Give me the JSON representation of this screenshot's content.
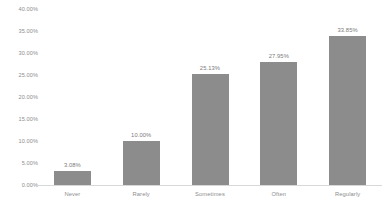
{
  "chart_data": {
    "type": "bar",
    "title": "",
    "xlabel": "",
    "ylabel": "",
    "categories": [
      "Never",
      "Rarely",
      "Sometimes",
      "Often",
      "Regularly"
    ],
    "values": [
      3.08,
      10.0,
      25.13,
      27.95,
      33.85
    ],
    "data_labels": [
      "3.08%",
      "10.00%",
      "25.13%",
      "27.95%",
      "33.85%"
    ],
    "ylim": [
      0,
      40
    ],
    "ytick_values": [
      40,
      35,
      30,
      25,
      20,
      15,
      10,
      5,
      0
    ],
    "ytick_labels": [
      "40.00%",
      "35.00%",
      "30.00%",
      "25.00%",
      "20.00%",
      "15.00%",
      "10.00%",
      "5.00%",
      "0.00%"
    ],
    "grid": false,
    "legend": false,
    "series": [
      {
        "name": "Series 1",
        "values": [
          3.08,
          10.0,
          25.13,
          27.95,
          33.85
        ],
        "color": "#8c8c8c"
      }
    ]
  },
  "colors": {
    "background": "#ffffff",
    "bar_fill": "#8c8c8c",
    "axis_line": "#d8d8d8",
    "tick_text": "#8d8d8d",
    "label_text": "#7b7b7b"
  }
}
